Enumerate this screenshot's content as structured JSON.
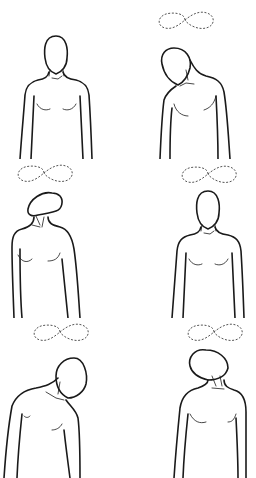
{
  "figure": {
    "background_color": "#ffffff",
    "line_color": "#1a1a1a",
    "motion_path_color": "#555555",
    "panels": [
      {
        "id": "p1",
        "position": "neutral-front",
        "motion_indicator": false
      },
      {
        "id": "p2",
        "position": "tilt-forward-right",
        "motion_indicator": true
      },
      {
        "id": "p3",
        "position": "tilt-back-left",
        "motion_indicator": true
      },
      {
        "id": "p4",
        "position": "neutral-front",
        "motion_indicator": true
      },
      {
        "id": "p5",
        "position": "tilt-down-right",
        "motion_indicator": true
      },
      {
        "id": "p6",
        "position": "tilt-back-left",
        "motion_indicator": true
      }
    ]
  }
}
